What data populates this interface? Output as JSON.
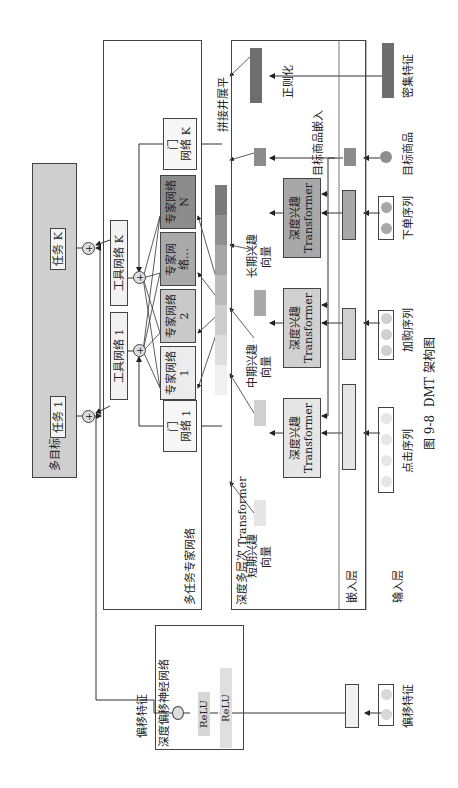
{
  "figure": {
    "caption_number": "图 9-8",
    "caption_title": "DMT 架构图"
  },
  "multi_objective": {
    "title": "多目标",
    "tasks": [
      {
        "label": "任务 1"
      },
      {
        "label": "任务 K"
      }
    ]
  },
  "mmoe": {
    "title": "多任务专家网络",
    "towers": [
      {
        "label": "工具网络 1"
      },
      {
        "label": "工具网络 K"
      }
    ],
    "gates": [
      {
        "line1": "门",
        "line2": "网络 1"
      },
      {
        "line1": "门",
        "line2": "网络 K"
      }
    ],
    "experts": [
      {
        "label": "专家网络 1",
        "color": "#ececec"
      },
      {
        "label": "专家网络 2",
        "color": "#c9c9c9"
      },
      {
        "label": "专家网络…",
        "color": "#aaaaaa"
      },
      {
        "label": "专家网络 N",
        "color": "#8c8c8c"
      }
    ],
    "plus_symbol": "+"
  },
  "concat_label": "拼接并展平",
  "concat_segments": [
    "#f0f0f0",
    "#dedede",
    "#cdcdcd",
    "#bbbbbb",
    "#a5a5a5",
    "#8f8f8f",
    "#7a7a7a"
  ],
  "transformer_section": {
    "title": "深度多层次 Transformer",
    "embedding_layer_label": "嵌入层",
    "input_layer_label": "输入层",
    "branches": [
      {
        "vector_line1": "短期兴趣",
        "vector_line2": "向量",
        "block_line1": "深度兴趣",
        "block_line2": "Transformer",
        "sequence": "点击序列",
        "color": "#e6e6e6"
      },
      {
        "vector_line1": "中期兴趣",
        "vector_line2": "向量",
        "block_line1": "深度兴趣",
        "block_line2": "Transformer",
        "sequence": "加购序列",
        "color": "#d0d0d0"
      },
      {
        "vector_line1": "长期兴趣",
        "vector_line2": "向量",
        "block_line1": "深度兴趣",
        "block_line2": "Transformer",
        "sequence": "下单序列",
        "color": "#a8a8a8"
      }
    ],
    "target_item_embedding_label": "目标商品嵌入",
    "target_item_label": "目标商品",
    "normalize_label": "正则化",
    "dense_feature_label": "密集特征"
  },
  "bias_network": {
    "title": "深度偏移神经网络",
    "layers": [
      "ReLU",
      "ReLU"
    ],
    "output_label": "偏移特征",
    "input_label": "偏移特征"
  }
}
